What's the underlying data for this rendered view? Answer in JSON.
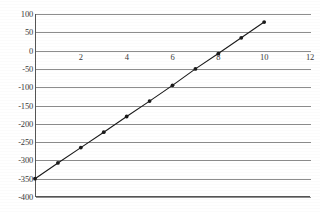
{
  "chart_data": {
    "type": "line",
    "title": "",
    "xlabel": "",
    "ylabel": "",
    "xlim": [
      0,
      12
    ],
    "ylim": [
      -400,
      100
    ],
    "grid": true,
    "legend": null,
    "markers": "filled-circle",
    "line_color": "#1a1a1a",
    "grid_color": "#8d8d8d",
    "axis_color": "#555555",
    "x_ticks": [
      2,
      4,
      6,
      8,
      10,
      12
    ],
    "x_tick_labels": [
      "2",
      "4",
      "6",
      "8",
      "10",
      "12"
    ],
    "y_ticks": [
      100,
      50,
      0,
      -50,
      -100,
      -150,
      -200,
      -250,
      -300,
      -350,
      -400
    ],
    "y_tick_labels": [
      "100",
      "50",
      "0",
      "-50",
      "-100",
      "-150",
      "-200",
      "-250",
      "-300",
      "-350",
      "-400"
    ],
    "x": [
      0,
      1,
      2,
      3,
      4,
      5,
      6,
      7,
      8,
      9,
      10
    ],
    "values": [
      -350,
      -307,
      -265,
      -223,
      -180,
      -138,
      -95,
      -50,
      -8,
      35,
      78
    ],
    "series": [
      {
        "name": "series-1",
        "points": [
          {
            "x": 0,
            "y": -350
          },
          {
            "x": 1,
            "y": -307
          },
          {
            "x": 2,
            "y": -265
          },
          {
            "x": 3,
            "y": -223
          },
          {
            "x": 4,
            "y": -180
          },
          {
            "x": 5,
            "y": -138
          },
          {
            "x": 6,
            "y": -95
          },
          {
            "x": 7,
            "y": -50
          },
          {
            "x": 8,
            "y": -8
          },
          {
            "x": 9,
            "y": 35
          },
          {
            "x": 10,
            "y": 78
          }
        ]
      }
    ]
  }
}
